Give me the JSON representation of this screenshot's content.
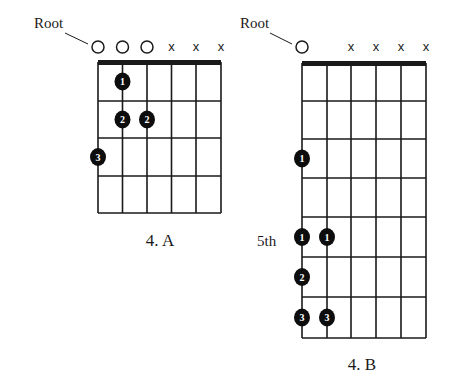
{
  "diagrams": [
    {
      "id": "4a",
      "caption": "4. A",
      "root_label": "Root",
      "side_label": "",
      "geometry": {
        "left": 98,
        "right": 221,
        "string_x": [
          98,
          122.5,
          147,
          171.5,
          196,
          221
        ],
        "nut_y": 62,
        "fret_y": [
          62,
          101,
          138,
          176,
          213
        ],
        "marker_y": 47,
        "caption_x": 160,
        "caption_y": 246,
        "root_text_x": 34,
        "root_text_y": 28,
        "root_line": [
          65,
          33,
          88,
          44
        ],
        "side_text_x": 0,
        "side_text_y": 0
      },
      "string_markers": [
        "open",
        "open",
        "open",
        "muted",
        "muted",
        "muted"
      ],
      "dots": [
        {
          "string": 2,
          "fret": 1,
          "finger": "1"
        },
        {
          "string": 2,
          "fret": 2,
          "finger": "2"
        },
        {
          "string": 3,
          "fret": 2,
          "finger": "2"
        },
        {
          "string": 1,
          "fret": 3,
          "finger": "3"
        }
      ]
    },
    {
      "id": "4b",
      "caption": "4. B",
      "root_label": "Root",
      "side_label": "5th",
      "geometry": {
        "left": 302,
        "right": 426,
        "string_x": [
          302,
          327,
          351,
          376,
          401,
          426
        ],
        "nut_y": 63,
        "fret_y": [
          63,
          101,
          139,
          178,
          217,
          257,
          297,
          338
        ],
        "marker_y": 47,
        "caption_x": 362,
        "caption_y": 370,
        "root_text_x": 240,
        "root_text_y": 28,
        "root_line": [
          270,
          33,
          292,
          44
        ],
        "side_text_x": 257,
        "side_text_y": 246
      },
      "string_markers": [
        "open",
        "none",
        "muted",
        "muted",
        "muted",
        "muted"
      ],
      "dots": [
        {
          "string": 1,
          "fret": 3,
          "finger": "1"
        },
        {
          "string": 1,
          "fret": 5,
          "finger": "1"
        },
        {
          "string": 2,
          "fret": 5,
          "finger": "1"
        },
        {
          "string": 1,
          "fret": 6,
          "finger": "2"
        },
        {
          "string": 1,
          "fret": 7,
          "finger": "3"
        },
        {
          "string": 2,
          "fret": 7,
          "finger": "3"
        }
      ]
    }
  ],
  "symbols": {
    "muted": "x",
    "open": "circle"
  },
  "colors": {
    "ink": "#1a1a1a",
    "dot_fill": "#0d0d0d",
    "dot_text": "#ffffff",
    "background": "#ffffff"
  }
}
